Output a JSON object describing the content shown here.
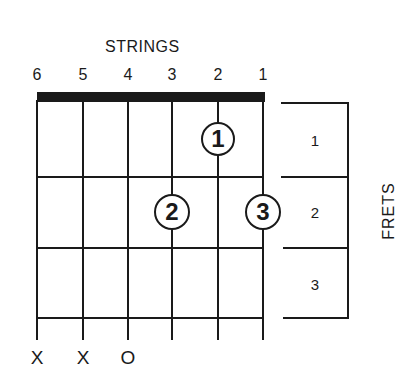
{
  "diagram": {
    "strings_title": "STRINGS",
    "frets_title": "FRETS",
    "string_numbers": [
      "6",
      "5",
      "4",
      "3",
      "2",
      "1"
    ],
    "fret_numbers": [
      "1",
      "2",
      "3"
    ],
    "fingers": [
      {
        "finger": "1",
        "string": 2,
        "fret": 1
      },
      {
        "finger": "2",
        "string": 3,
        "fret": 2
      },
      {
        "finger": "3",
        "string": 1,
        "fret": 2
      }
    ],
    "string_markers": [
      {
        "string": 6,
        "mark": "X"
      },
      {
        "string": 5,
        "mark": "X"
      },
      {
        "string": 4,
        "mark": "O"
      }
    ]
  }
}
